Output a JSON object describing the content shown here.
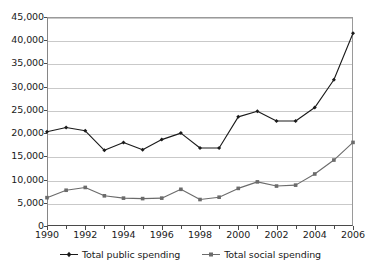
{
  "chart_data": {
    "type": "line",
    "title": "",
    "subtitle": "",
    "xlabel": "",
    "ylabel": "",
    "x": [
      1990,
      1991,
      1992,
      1993,
      1994,
      1995,
      1996,
      1997,
      1998,
      1999,
      2000,
      2001,
      2002,
      2003,
      2004,
      2005,
      2006
    ],
    "categories": [
      "1990",
      "1991",
      "1992",
      "1993",
      "1994",
      "1995",
      "1996",
      "1997",
      "1998",
      "1999",
      "2000",
      "2001",
      "2002",
      "2003",
      "2004",
      "2005",
      "2006"
    ],
    "series": [
      {
        "name": "Total public spending",
        "color": "#1a1a1a",
        "marker": "diamond",
        "values": [
          20300,
          21200,
          20500,
          16300,
          18000,
          16400,
          18600,
          20000,
          16800,
          16800,
          23500,
          24700,
          22600,
          22600,
          25500,
          31500,
          41500
        ]
      },
      {
        "name": "Total social spending",
        "color": "#6b6b6b",
        "marker": "square",
        "values": [
          6100,
          7700,
          8300,
          6500,
          6000,
          5900,
          6000,
          7900,
          5700,
          6200,
          8100,
          9500,
          8600,
          8800,
          11200,
          14200,
          18000
        ]
      }
    ],
    "ylim": [
      0,
      45000
    ],
    "xlim": [
      1990,
      2006
    ],
    "ytick_step": 5000,
    "ytick_labels": [
      "0",
      "5,000",
      "10,000",
      "15,000",
      "20,000",
      "25,000",
      "30,000",
      "35,000",
      "40,000",
      "45,000"
    ],
    "ytick_values": [
      0,
      5000,
      10000,
      15000,
      20000,
      25000,
      30000,
      35000,
      40000,
      45000
    ],
    "xtick_labels": [
      "1990",
      "1992",
      "1994",
      "1996",
      "1998",
      "2000",
      "2002",
      "2004",
      "2006"
    ],
    "xtick_values": [
      1990,
      1992,
      1994,
      1996,
      1998,
      2000,
      2002,
      2004,
      2006
    ],
    "xtick_minor_values": [
      1991,
      1993,
      1995,
      1997,
      1999,
      2001,
      2003,
      2005
    ],
    "grid": {
      "horizontal": true,
      "vertical": false,
      "color": "#c9c9c9"
    },
    "legend": {
      "position": "bottom",
      "entries": [
        "Total public spending",
        "Total social spending"
      ]
    },
    "plot_background": "#ffffff",
    "frame_color": "#9a9a9a"
  }
}
